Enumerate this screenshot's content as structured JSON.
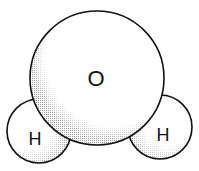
{
  "diagram": {
    "type": "space-filling molecule model",
    "molecule": "water",
    "atoms": [
      {
        "id": "oxygen",
        "label": "O",
        "cx": 97,
        "cy": 78,
        "r": 67
      },
      {
        "id": "hydrogen-left",
        "label": "H",
        "cx": 39,
        "cy": 131,
        "r": 32
      },
      {
        "id": "hydrogen-right",
        "label": "H",
        "cx": 160,
        "cy": 127,
        "r": 32
      }
    ],
    "colors": {
      "outline": "#111111",
      "fill": "#ffffff",
      "shade": "#bdbdbd"
    }
  }
}
